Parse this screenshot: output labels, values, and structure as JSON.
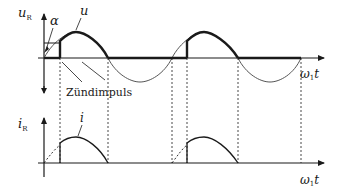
{
  "top_plot": {
    "y_label": "u",
    "y_label_sub": "R",
    "x_label": "ω",
    "x_label_sub": "1",
    "x_label_tail": "t",
    "curve_label": "u",
    "angle_label": "α",
    "annotation": "Zündimpuls"
  },
  "bottom_plot": {
    "y_label": "i",
    "y_label_sub": "R",
    "x_label": "ω",
    "x_label_sub": "1",
    "x_label_tail": "t",
    "curve_label": "i"
  },
  "colors": {
    "line": "#1a1a1a",
    "thin": "#555555"
  }
}
